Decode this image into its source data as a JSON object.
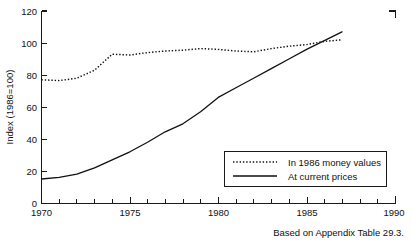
{
  "chart_data": {
    "type": "line",
    "title": "",
    "xlabel": "",
    "ylabel": "Index (1986=100)",
    "xlim": [
      1970,
      1990
    ],
    "ylim": [
      0,
      120
    ],
    "ytick_step": 20,
    "yticks": [
      0,
      20,
      40,
      60,
      80,
      100,
      120
    ],
    "yticklabels": [
      "0",
      "20",
      "40",
      "60",
      "80",
      "100",
      "120"
    ],
    "xticks": [
      1970,
      1975,
      1980,
      1985,
      1990
    ],
    "xticklabels": [
      "1970",
      "1975",
      "1980",
      "1985",
      "1990"
    ],
    "xminor_step": 1,
    "grid": false,
    "legend_position": "lower right",
    "x": [
      1970,
      1971,
      1972,
      1973,
      1974,
      1975,
      1976,
      1977,
      1978,
      1979,
      1980,
      1981,
      1982,
      1983,
      1984,
      1985,
      1986,
      1987
    ],
    "series": [
      {
        "name": "In 1986 money values",
        "style": "dotted",
        "values": [
          77,
          76.5,
          78,
          83,
          93,
          92.5,
          94,
          95,
          95.5,
          96.5,
          96,
          95,
          94.5,
          96.5,
          98,
          99,
          101,
          102
        ]
      },
      {
        "name": "At current prices",
        "style": "solid",
        "values": [
          15,
          16,
          18,
          22,
          27,
          32,
          38,
          44.5,
          49.5,
          57,
          66,
          72,
          78,
          84,
          90,
          96,
          101.5,
          107
        ]
      }
    ],
    "caption": "Based on Appendix Table 29.3."
  },
  "legend": {
    "entries": [
      {
        "label": "In 1986 money values"
      },
      {
        "label": "At current prices"
      }
    ]
  },
  "axes": {
    "y_title": "Index (1986=100)",
    "y_labels": [
      "120",
      "100",
      "80",
      "60",
      "40",
      "20",
      "0"
    ],
    "x_labels": [
      "1970",
      "1975",
      "1980",
      "1985",
      "1990"
    ]
  },
  "caption": {
    "text": "Based on Appendix Table 29.3."
  },
  "colors": {
    "ink": "#111111",
    "background": "#ffffff"
  }
}
